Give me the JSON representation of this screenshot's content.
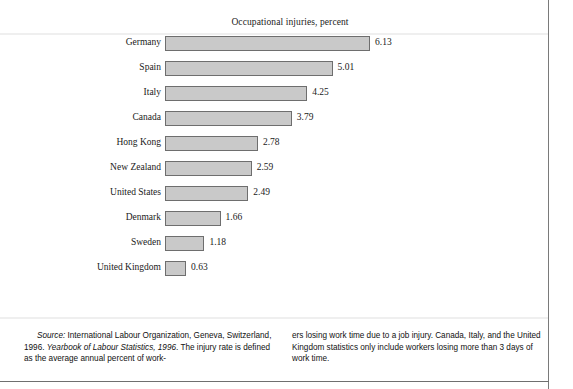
{
  "chart_data": {
    "type": "bar",
    "orientation": "horizontal",
    "title": "Occupational injuries, percent",
    "xlabel": "",
    "ylabel": "",
    "categories": [
      "Germany",
      "Spain",
      "Italy",
      "Canada",
      "Hong Kong",
      "New Zealand",
      "United States",
      "Denmark",
      "Sweden",
      "United Kingdom"
    ],
    "values": [
      6.13,
      5.01,
      4.25,
      3.79,
      2.78,
      2.59,
      2.49,
      1.66,
      1.18,
      0.63
    ],
    "value_labels": [
      "6.13",
      "5.01",
      "4.25",
      "3.79",
      "2.78",
      "2.59",
      "2.49",
      "1.66",
      "1.18",
      "0.63"
    ],
    "xlim": [
      0,
      6.13
    ],
    "grid": false,
    "legend": null,
    "bar_fill_color": "#c9c9c9",
    "bar_border_color": "#6e6e6e"
  },
  "footnote": {
    "left_column": {
      "source_label": "Source:",
      "line1_rest": " International Labour Organization, Geneva,",
      "line2_a": "Switzerland, 1996. ",
      "line2_italic": "Yearbook of Labour Statistics, 1996",
      "line2_b": ". The",
      "line3": "injury rate is defined as the average annual percent of work-"
    },
    "right_column": {
      "line1": "ers losing work time due to a job injury. Canada, Italy, and",
      "line2": "the United Kingdom statistics only include workers losing",
      "line3": "more than 3 days of work time."
    }
  }
}
